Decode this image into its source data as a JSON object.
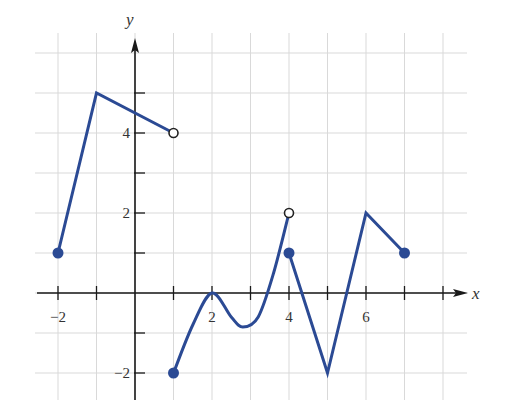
{
  "chart_data": {
    "type": "line",
    "title": "",
    "xlabel": "x",
    "ylabel": "y",
    "xlim": [
      -2.6,
      8.6
    ],
    "ylim": [
      -2.7,
      6.5
    ],
    "grid": true,
    "x_ticks": [
      -2,
      -1,
      0,
      1,
      2,
      3,
      4,
      5,
      6,
      7,
      8
    ],
    "x_tick_labels": [
      {
        "x": -2,
        "label": "−2"
      },
      {
        "x": 2,
        "label": "2"
      },
      {
        "x": 4,
        "label": "4"
      },
      {
        "x": 6,
        "label": "6"
      }
    ],
    "y_ticks": [
      -2,
      -1,
      1,
      2,
      3,
      4,
      5
    ],
    "y_tick_labels": [
      {
        "y": -2,
        "label": "−2"
      },
      {
        "y": 2,
        "label": "2"
      },
      {
        "y": 4,
        "label": "4"
      }
    ],
    "series": [
      {
        "name": "piece-1",
        "points": [
          [
            -2,
            1
          ],
          [
            -1,
            5
          ],
          [
            1,
            4
          ]
        ],
        "start": "closed",
        "end": "open",
        "curve": "linear"
      },
      {
        "name": "piece-2",
        "points": [
          [
            1,
            -2
          ],
          [
            1.5,
            -0.8
          ],
          [
            2,
            0
          ],
          [
            2.5,
            -0.6
          ],
          [
            2.8,
            -0.85
          ],
          [
            3.2,
            -0.6
          ],
          [
            3.6,
            0.5
          ],
          [
            4,
            2
          ]
        ],
        "start": "closed",
        "end": "open",
        "curve": "smooth"
      },
      {
        "name": "piece-3",
        "points": [
          [
            4,
            1
          ],
          [
            5,
            -2
          ],
          [
            6,
            2
          ],
          [
            7,
            1
          ]
        ],
        "start": "closed",
        "end": "closed",
        "curve": "linear"
      }
    ],
    "line_color": "#2b4a94",
    "axis_color": "#1a1a1a",
    "grid_color": "#d9d9d9"
  }
}
